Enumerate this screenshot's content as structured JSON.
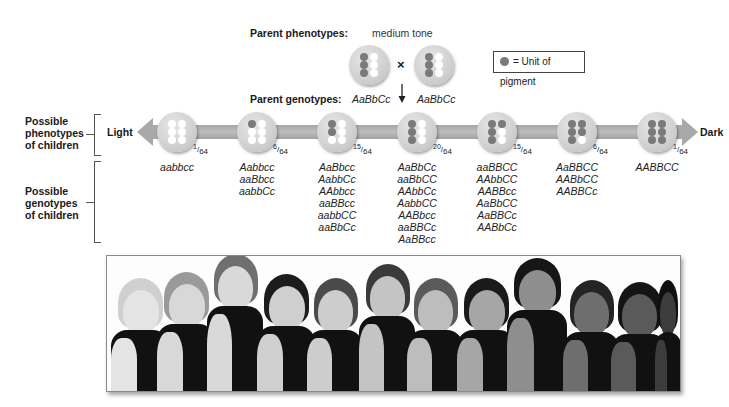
{
  "header": {
    "parent_phenotypes_label": "Parent phenotypes:",
    "parent_phenotype_value": "medium tone",
    "parent_genotypes_label": "Parent genotypes:",
    "parent1_genotype": "AaBbCc",
    "parent2_genotype": "AaBbCc",
    "cross_symbol": "×",
    "down_arrow_icon": "arrow-down",
    "parent_pigment_units": 3
  },
  "legend": {
    "dot_icon": "pigment-dot",
    "label": "= Unit of pigment",
    "pigment_color": "#7a7a7a"
  },
  "row_labels": {
    "phenotypes": [
      "Possible",
      "phenotypes",
      "of children"
    ],
    "genotypes": [
      "Possible",
      "genotypes",
      "of children"
    ]
  },
  "scale": {
    "left_label": "Light",
    "right_label": "Dark",
    "bar_color": "#b0b0b0"
  },
  "classes": [
    {
      "pigment_units": 0,
      "fraction_num": "1",
      "fraction_den": "64",
      "genotypes": [
        "aabbcc"
      ]
    },
    {
      "pigment_units": 1,
      "fraction_num": "6",
      "fraction_den": "64",
      "genotypes": [
        "Aabbcc",
        "aaBbcc",
        "aabbCc"
      ]
    },
    {
      "pigment_units": 2,
      "fraction_num": "15",
      "fraction_den": "64",
      "genotypes": [
        "AaBbcc",
        "AabbCc",
        "AAbbcc",
        "aaBBcc",
        "aabbCC",
        "aaBbCc"
      ]
    },
    {
      "pigment_units": 3,
      "fraction_num": "20",
      "fraction_den": "64",
      "genotypes": [
        "AaBbCc",
        "aaBbCC",
        "AAbbCc",
        "AabbCC",
        "AABbcc",
        "aaBBCc",
        "AaBBcc"
      ]
    },
    {
      "pigment_units": 4,
      "fraction_num": "15",
      "fraction_den": "64",
      "genotypes": [
        "aaBBCC",
        "AAbbCC",
        "AABBcc",
        "AaBbCC",
        "AaBBCc",
        "AABbCc"
      ]
    },
    {
      "pigment_units": 5,
      "fraction_num": "6",
      "fraction_den": "64",
      "genotypes": [
        "AaBBCC",
        "AABbCC",
        "AABBCc"
      ]
    },
    {
      "pigment_units": 6,
      "fraction_num": "1",
      "fraction_den": "64",
      "genotypes": [
        "AABBCC"
      ]
    }
  ],
  "photo": {
    "description": "Row of twelve children arranged from lightest to darkest skin tone, black-and-white photograph",
    "children_count": 12
  }
}
